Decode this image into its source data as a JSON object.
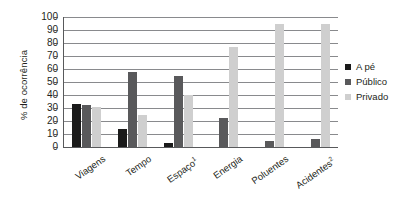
{
  "chart_data": {
    "type": "bar",
    "title": "",
    "xlabel": "",
    "ylabel": "% de ocorrência",
    "ylim": [
      0,
      100
    ],
    "ytick_step": 10,
    "yticks": [
      100,
      90,
      80,
      70,
      60,
      50,
      40,
      30,
      20,
      10,
      0
    ],
    "grid": true,
    "legend_position": "right",
    "categories": [
      "Viagens",
      "Tempo",
      "Espaço",
      "Energia",
      "Poluentes",
      "Acidentes"
    ],
    "category_superscripts": [
      "",
      "",
      "1",
      "",
      "",
      "2"
    ],
    "series": [
      {
        "name": "A pé",
        "color": "#1a1a1a",
        "values": [
          33,
          14,
          3,
          0,
          0,
          0
        ]
      },
      {
        "name": "Público",
        "color": "#59595b",
        "values": [
          32,
          58,
          55,
          22,
          5,
          6
        ]
      },
      {
        "name": "Privado",
        "color": "#cfcfcf",
        "values": [
          31,
          25,
          40,
          77,
          95,
          95
        ]
      }
    ]
  },
  "legend": {
    "items": [
      {
        "label": "A pé"
      },
      {
        "label": "Público"
      },
      {
        "label": "Privado"
      }
    ]
  }
}
